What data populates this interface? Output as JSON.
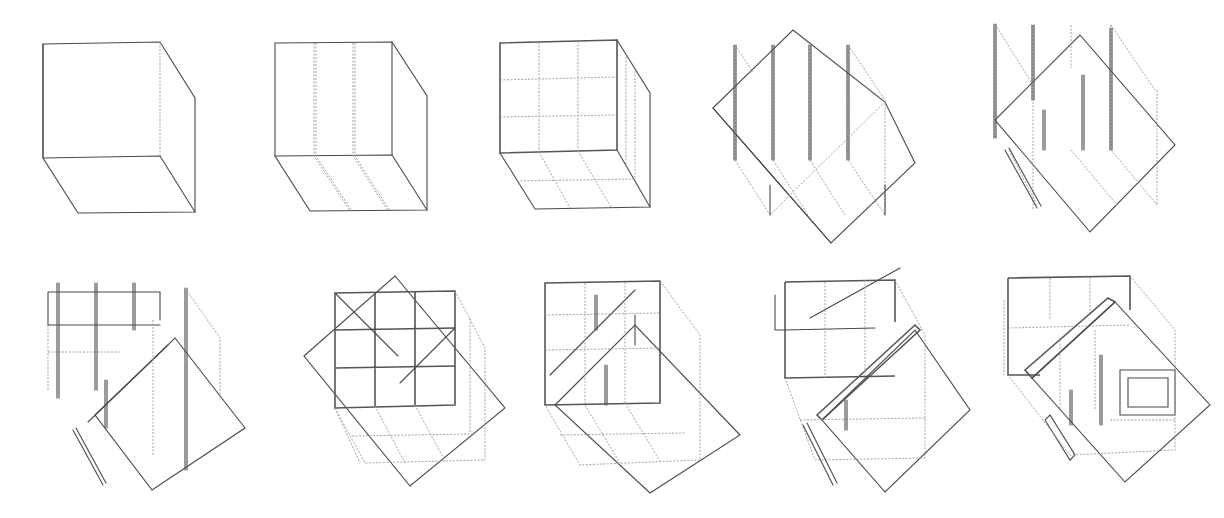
{
  "figure": {
    "background": "#ffffff",
    "stroke_color": "#4a4a4a",
    "rows": 2,
    "columns": 5,
    "sketches": [
      {
        "id": 1,
        "row": 0,
        "col": 0,
        "box": [
          38,
          40,
          160,
          180
        ],
        "description": "plain cube outline"
      },
      {
        "id": 2,
        "row": 0,
        "col": 1,
        "box": [
          270,
          40,
          160,
          180
        ],
        "description": "cube front face divided into three vertical bays"
      },
      {
        "id": 3,
        "row": 0,
        "col": 2,
        "box": [
          495,
          35,
          150,
          180
        ],
        "description": "cube front face divided into 3x3 grid with gridded floor"
      },
      {
        "id": 4,
        "row": 0,
        "col": 3,
        "box": [
          705,
          30,
          210,
          215
        ],
        "description": "four vertical columns with rotated diagonal planes"
      },
      {
        "id": 5,
        "row": 0,
        "col": 4,
        "box": [
          975,
          20,
          210,
          215
        ],
        "description": "columns and rotated planes with additional posts"
      },
      {
        "id": 6,
        "row": 1,
        "col": 0,
        "box": [
          40,
          280,
          205,
          215
        ],
        "description": "framed cube with inserted diagonal slab"
      },
      {
        "id": 7,
        "row": 1,
        "col": 1,
        "box": [
          300,
          268,
          220,
          220
        ],
        "description": "dense 3x3 frame overlapped by rotated square"
      },
      {
        "id": 8,
        "row": 1,
        "col": 2,
        "box": [
          540,
          275,
          200,
          220
        ],
        "description": "frame with diagonal planes cutting through"
      },
      {
        "id": 9,
        "row": 1,
        "col": 3,
        "box": [
          765,
          270,
          210,
          225
        ],
        "description": "frame with thickened diagonal walls"
      },
      {
        "id": 10,
        "row": 1,
        "col": 4,
        "box": [
          1000,
          270,
          210,
          225
        ],
        "description": "final layered frame with rotated openings"
      }
    ]
  }
}
